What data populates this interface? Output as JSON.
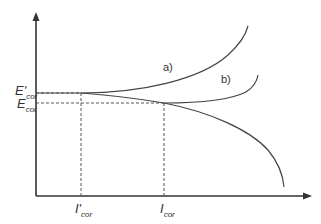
{
  "diagram": {
    "type": "polarization-curves",
    "colors": {
      "line": "#444444",
      "text": "#333333",
      "background": "#ffffff"
    },
    "axes": {
      "y_axis": {
        "label": ""
      },
      "x_axis": {
        "label": ""
      }
    },
    "labels": {
      "e_prime_cor": {
        "main": "E'",
        "sub": "cor"
      },
      "e_cor": {
        "main": "E",
        "sub": "cor"
      },
      "i_prime_cor": {
        "main": "I'",
        "sub": "cor"
      },
      "i_cor": {
        "main": "I",
        "sub": "cor"
      }
    },
    "curves": [
      {
        "id": "a",
        "label": "a)"
      },
      {
        "id": "b",
        "label": "b)"
      }
    ]
  }
}
